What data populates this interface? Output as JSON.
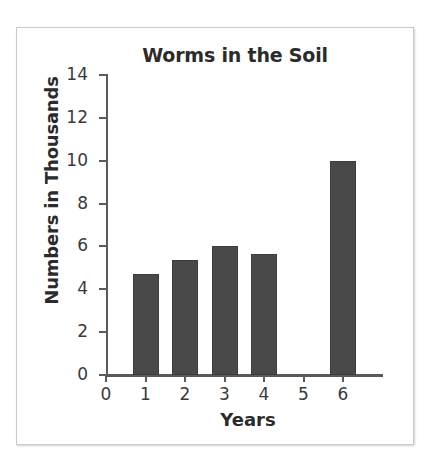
{
  "chart_data": {
    "type": "bar",
    "title": "Worms in the Soil",
    "xlabel": "Years",
    "ylabel": "Numbers in Thousands",
    "categories": [
      "1",
      "2",
      "3",
      "4",
      "5",
      "6"
    ],
    "values": [
      4.7,
      5.35,
      6.0,
      5.65,
      0,
      10.0
    ],
    "x_tick_labels": [
      "0",
      "1",
      "2",
      "3",
      "4",
      "5",
      "6"
    ],
    "y_tick_labels": [
      "0",
      "2",
      "4",
      "6",
      "8",
      "10",
      "12",
      "14"
    ],
    "y_ticks": [
      0,
      2,
      4,
      6,
      8,
      10,
      12,
      14
    ],
    "xlim": [
      0,
      6.6
    ],
    "ylim": [
      0,
      14
    ],
    "grid": false,
    "legend": null,
    "bar_color": "#494949",
    "axis_color": "#5a5a5a",
    "text_color": "#2b2b2b",
    "background": "#ffffff",
    "border_color": "#c9c9c9"
  }
}
